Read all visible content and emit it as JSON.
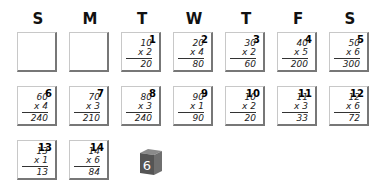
{
  "headers": [
    "S",
    "M",
    "T",
    "W",
    "T",
    "F",
    "S"
  ],
  "cards": [
    {
      "num": "",
      "a": "",
      "b": "",
      "ans": ""
    },
    {
      "num": "",
      "a": "",
      "b": "",
      "ans": ""
    },
    {
      "num": "1",
      "a": "10",
      "b": "x 2",
      "ans": "20"
    },
    {
      "num": "2",
      "a": "20",
      "b": "x 4",
      "ans": "80"
    },
    {
      "num": "3",
      "a": "30",
      "b": "x 2",
      "ans": "60"
    },
    {
      "num": "4",
      "a": "40",
      "b": "x 5",
      "ans": "200"
    },
    {
      "num": "5",
      "a": "50",
      "b": "x 6",
      "ans": "300"
    },
    {
      "num": "6",
      "a": "60",
      "b": "x 4",
      "ans": "240"
    },
    {
      "num": "7",
      "a": "70",
      "b": "x 3",
      "ans": "210"
    },
    {
      "num": "8",
      "a": "80",
      "b": "x 3",
      "ans": "240"
    },
    {
      "num": "9",
      "a": "90",
      "b": "x 1",
      "ans": "90"
    },
    {
      "num": "10",
      "a": "10",
      "b": "x 2",
      "ans": "20"
    },
    {
      "num": "11",
      "a": "11",
      "b": "x 3",
      "ans": "33"
    },
    {
      "num": "12",
      "a": "12",
      "b": "x 6",
      "ans": "72"
    },
    {
      "num": "13",
      "a": "13",
      "b": "x 1",
      "ans": "13"
    },
    {
      "num": "14",
      "a": "14",
      "b": "x 6",
      "ans": "84"
    }
  ],
  "die": {
    "face": "6",
    "color": "#5a5a5a"
  }
}
